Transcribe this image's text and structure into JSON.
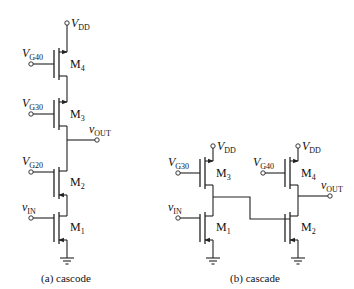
{
  "figure": {
    "panel_a": {
      "caption": "(a) cascode",
      "supply": {
        "main": "V",
        "sub": "DD"
      },
      "output": {
        "main": "v",
        "sub": "OUT"
      },
      "transistors": [
        {
          "name": "M",
          "sub": "4",
          "gate": {
            "main": "V",
            "sub": "G40"
          }
        },
        {
          "name": "M",
          "sub": "3",
          "gate": {
            "main": "V",
            "sub": "G30"
          }
        },
        {
          "name": "M",
          "sub": "2",
          "gate": {
            "main": "V",
            "sub": "G20"
          }
        },
        {
          "name": "M",
          "sub": "1",
          "gate": {
            "main": "v",
            "sub": "IN"
          }
        }
      ]
    },
    "panel_b": {
      "caption": "(b) cascade",
      "left_stage": {
        "supply": {
          "main": "V",
          "sub": "DD"
        },
        "transistors": [
          {
            "name": "M",
            "sub": "3",
            "gate": {
              "main": "V",
              "sub": "G30"
            }
          },
          {
            "name": "M",
            "sub": "1",
            "gate": {
              "main": "v",
              "sub": "IN"
            }
          }
        ]
      },
      "right_stage": {
        "supply": {
          "main": "V",
          "sub": "DD"
        },
        "output": {
          "main": "v",
          "sub": "OUT"
        },
        "transistors": [
          {
            "name": "M",
            "sub": "4",
            "gate": {
              "main": "V",
              "sub": "G40"
            }
          },
          {
            "name": "M",
            "sub": "2",
            "gate": {
              "main": "",
              "sub": ""
            }
          }
        ]
      }
    }
  }
}
